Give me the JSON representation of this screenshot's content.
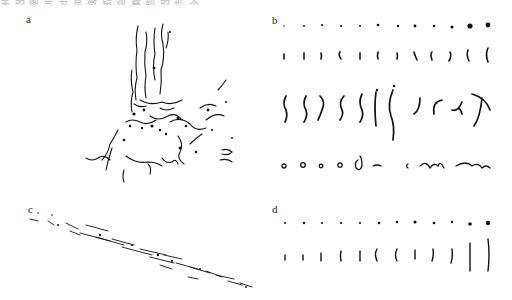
{
  "caption_fragment": "关 的 图 片 为 显 微 镜 观 察 到 的 形 态",
  "panels": [
    {
      "id": "a",
      "label": "a",
      "description": "dense branching stroke cluster (tree-like deposit)"
    },
    {
      "id": "b",
      "label": "b",
      "description": "grid of isolated stroke shapes, 4 rows × 12 columns, increasing size",
      "rows": [
        "dots",
        "short ticks",
        "curved strokes",
        "loops and squiggles"
      ]
    },
    {
      "id": "c",
      "label": "c",
      "description": "diagonal streak of elongated fragments"
    },
    {
      "id": "d",
      "label": "d",
      "description": "grid of isolated stroke shapes, 2 rows × 12 columns, increasing size",
      "rows": [
        "dots",
        "vertical ticks"
      ]
    }
  ]
}
